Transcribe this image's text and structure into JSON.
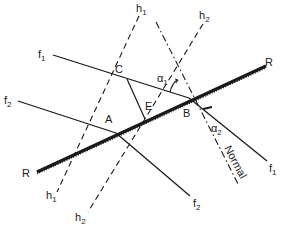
{
  "diagram": {
    "type": "wave-refraction-geometry",
    "colors": {
      "ink": "#1a1a1a",
      "background": "#ffffff"
    },
    "reflector": {
      "label_left": "R",
      "label_right": "R"
    },
    "points": [
      {
        "id": "A",
        "label": "A"
      },
      {
        "id": "B",
        "label": "B"
      },
      {
        "id": "C",
        "label": "C"
      },
      {
        "id": "E",
        "label": "E"
      }
    ],
    "rays": [
      {
        "id": "f1",
        "label_upper": "f",
        "sub_upper": "1",
        "label_lower": "f",
        "sub_lower": "1"
      },
      {
        "id": "f2",
        "label_upper": "f",
        "sub_upper": "2",
        "label_lower": "f",
        "sub_lower": "2"
      }
    ],
    "wavefronts": [
      {
        "id": "h1",
        "label_upper": "h",
        "sub_upper": "1",
        "label_lower": "h",
        "sub_lower": "1"
      },
      {
        "id": "h2",
        "label_upper": "h",
        "sub_upper": "2",
        "label_lower": "h",
        "sub_lower": "2"
      }
    ],
    "angles": [
      {
        "id": "alpha1",
        "symbol": "α",
        "sub": "1"
      },
      {
        "id": "alpha2",
        "symbol": "α",
        "sub": "2"
      }
    ],
    "normal": {
      "label": "Normal"
    }
  }
}
